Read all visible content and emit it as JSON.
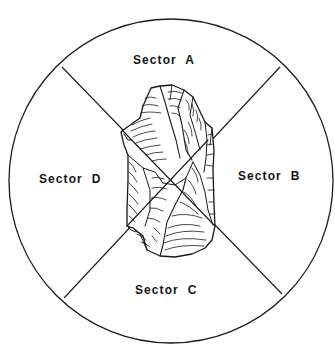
{
  "diagram": {
    "type": "sector-division of a lithic artifact",
    "colors": {
      "stroke": "#1a1a1a",
      "background": "#ffffff"
    },
    "circle": {
      "cx": 171,
      "cy": 181,
      "r": 162
    },
    "dividers": [
      {
        "from": [
          62,
          67
        ],
        "to": [
          282,
          294
        ]
      },
      {
        "from": [
          280,
          67
        ],
        "to": [
          64,
          298
        ]
      }
    ],
    "sectors": [
      {
        "id": "A",
        "label": "Sector  A",
        "position": "top"
      },
      {
        "id": "B",
        "label": "Sector  B",
        "position": "right"
      },
      {
        "id": "C",
        "label": "Sector  C",
        "position": "bottom"
      },
      {
        "id": "D",
        "label": "Sector  D",
        "position": "left"
      }
    ],
    "artifact": {
      "name": "flaked stone tool drawing",
      "center": [
        172,
        172
      ]
    }
  }
}
